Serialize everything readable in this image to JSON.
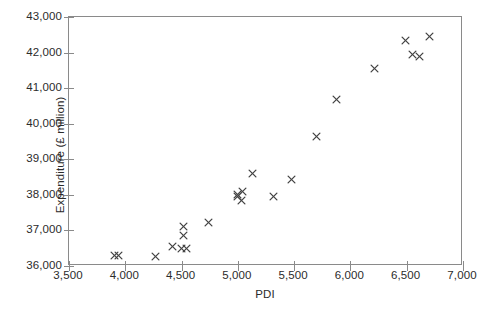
{
  "chart_data": {
    "type": "scatter",
    "title": "",
    "xlabel": "PDI",
    "ylabel": "Expenditure (£ million)",
    "xlim": [
      3500,
      7000
    ],
    "ylim": [
      36000,
      43000
    ],
    "xticks": [
      "3,500",
      "4,000",
      "4,500",
      "5,000",
      "5,500",
      "6,000",
      "6,500",
      "7,000"
    ],
    "xtick_values": [
      3500,
      4000,
      4500,
      5000,
      5500,
      6000,
      6500,
      7000
    ],
    "yticks": [
      "36,000",
      "37,000",
      "38,000",
      "39,000",
      "40,000",
      "41,000",
      "42,000",
      "43,000"
    ],
    "ytick_values": [
      36000,
      37000,
      38000,
      39000,
      40000,
      41000,
      42000,
      43000
    ],
    "grid": false,
    "legend": null,
    "marker": "x",
    "marker_color": "#444444",
    "frame_color": "#8a8a8a",
    "points": [
      {
        "x": 3900,
        "y": 36300
      },
      {
        "x": 3940,
        "y": 36300
      },
      {
        "x": 4270,
        "y": 36260
      },
      {
        "x": 4420,
        "y": 36560
      },
      {
        "x": 4500,
        "y": 36490
      },
      {
        "x": 4540,
        "y": 36490
      },
      {
        "x": 4520,
        "y": 36850
      },
      {
        "x": 4520,
        "y": 37120
      },
      {
        "x": 4740,
        "y": 37220
      },
      {
        "x": 5000,
        "y": 38020
      },
      {
        "x": 5000,
        "y": 37960
      },
      {
        "x": 5040,
        "y": 38100
      },
      {
        "x": 5030,
        "y": 37850
      },
      {
        "x": 5130,
        "y": 38600
      },
      {
        "x": 5320,
        "y": 37950
      },
      {
        "x": 5480,
        "y": 38430
      },
      {
        "x": 5700,
        "y": 39630
      },
      {
        "x": 5880,
        "y": 40670
      },
      {
        "x": 6210,
        "y": 41560
      },
      {
        "x": 6490,
        "y": 42330
      },
      {
        "x": 6550,
        "y": 41940
      },
      {
        "x": 6610,
        "y": 41880
      },
      {
        "x": 6700,
        "y": 42450
      }
    ]
  }
}
